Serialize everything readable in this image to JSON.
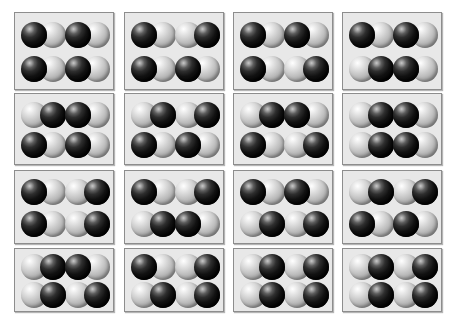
{
  "figure": {
    "grid_rows": 4,
    "grid_cols": 4,
    "molecules_per_cell": 4,
    "molecule_layout": "2x2",
    "colors": {
      "page_background": "#ffffff",
      "cell_background": "#e8e8e8",
      "cell_border": "#8d8d8d",
      "atom_dark": "#111111",
      "atom_light": "#c9c9c9"
    },
    "atom_types": {
      "dark": "dark-atom",
      "light": "light-atom"
    },
    "orientation_legend": {
      "dark-light": "dark sphere on the left, light sphere on the right",
      "light-dark": "light sphere on the left, dark sphere on the right"
    }
  },
  "cells": [
    {
      "id": "cell-r1c1",
      "row": 1,
      "col": 1,
      "x": 14,
      "y": 12,
      "w": 100,
      "h": 78,
      "molecules": [
        {
          "slot": "top-left",
          "orientation": "dark-light"
        },
        {
          "slot": "top-right",
          "orientation": "dark-light"
        },
        {
          "slot": "bottom-left",
          "orientation": "dark-light"
        },
        {
          "slot": "bottom-right",
          "orientation": "dark-light"
        }
      ]
    },
    {
      "id": "cell-r1c2",
      "row": 1,
      "col": 2,
      "x": 124,
      "y": 12,
      "w": 100,
      "h": 78,
      "molecules": [
        {
          "slot": "top-left",
          "orientation": "dark-light"
        },
        {
          "slot": "top-right",
          "orientation": "light-dark"
        },
        {
          "slot": "bottom-left",
          "orientation": "dark-light"
        },
        {
          "slot": "bottom-right",
          "orientation": "dark-light"
        }
      ]
    },
    {
      "id": "cell-r1c3",
      "row": 1,
      "col": 3,
      "x": 233,
      "y": 12,
      "w": 100,
      "h": 78,
      "molecules": [
        {
          "slot": "top-left",
          "orientation": "dark-light"
        },
        {
          "slot": "top-right",
          "orientation": "dark-light"
        },
        {
          "slot": "bottom-left",
          "orientation": "dark-light"
        },
        {
          "slot": "bottom-right",
          "orientation": "light-dark"
        }
      ]
    },
    {
      "id": "cell-r1c4",
      "row": 1,
      "col": 4,
      "x": 342,
      "y": 12,
      "w": 100,
      "h": 78,
      "molecules": [
        {
          "slot": "top-left",
          "orientation": "dark-light"
        },
        {
          "slot": "top-right",
          "orientation": "dark-light"
        },
        {
          "slot": "bottom-left",
          "orientation": "light-dark"
        },
        {
          "slot": "bottom-right",
          "orientation": "dark-light"
        }
      ]
    },
    {
      "id": "cell-r2c1",
      "row": 2,
      "col": 1,
      "x": 14,
      "y": 93,
      "w": 100,
      "h": 72,
      "molecules": [
        {
          "slot": "top-left",
          "orientation": "light-dark"
        },
        {
          "slot": "top-right",
          "orientation": "dark-light"
        },
        {
          "slot": "bottom-left",
          "orientation": "dark-light"
        },
        {
          "slot": "bottom-right",
          "orientation": "dark-light"
        }
      ]
    },
    {
      "id": "cell-r2c2",
      "row": 2,
      "col": 2,
      "x": 124,
      "y": 93,
      "w": 100,
      "h": 72,
      "molecules": [
        {
          "slot": "top-left",
          "orientation": "light-dark"
        },
        {
          "slot": "top-right",
          "orientation": "light-dark"
        },
        {
          "slot": "bottom-left",
          "orientation": "dark-light"
        },
        {
          "slot": "bottom-right",
          "orientation": "dark-light"
        }
      ]
    },
    {
      "id": "cell-r2c3",
      "row": 2,
      "col": 3,
      "x": 233,
      "y": 93,
      "w": 100,
      "h": 72,
      "molecules": [
        {
          "slot": "top-left",
          "orientation": "light-dark"
        },
        {
          "slot": "top-right",
          "orientation": "dark-light"
        },
        {
          "slot": "bottom-left",
          "orientation": "dark-light"
        },
        {
          "slot": "bottom-right",
          "orientation": "light-dark"
        }
      ]
    },
    {
      "id": "cell-r2c4",
      "row": 2,
      "col": 4,
      "x": 342,
      "y": 93,
      "w": 100,
      "h": 72,
      "molecules": [
        {
          "slot": "top-left",
          "orientation": "light-dark"
        },
        {
          "slot": "top-right",
          "orientation": "dark-light"
        },
        {
          "slot": "bottom-left",
          "orientation": "light-dark"
        },
        {
          "slot": "bottom-right",
          "orientation": "dark-light"
        }
      ]
    },
    {
      "id": "cell-r3c1",
      "row": 3,
      "col": 1,
      "x": 14,
      "y": 170,
      "w": 100,
      "h": 74,
      "molecules": [
        {
          "slot": "top-left",
          "orientation": "dark-light"
        },
        {
          "slot": "top-right",
          "orientation": "light-dark"
        },
        {
          "slot": "bottom-left",
          "orientation": "dark-light"
        },
        {
          "slot": "bottom-right",
          "orientation": "light-dark"
        }
      ]
    },
    {
      "id": "cell-r3c2",
      "row": 3,
      "col": 2,
      "x": 124,
      "y": 170,
      "w": 100,
      "h": 74,
      "molecules": [
        {
          "slot": "top-left",
          "orientation": "dark-light"
        },
        {
          "slot": "top-right",
          "orientation": "light-dark"
        },
        {
          "slot": "bottom-left",
          "orientation": "light-dark"
        },
        {
          "slot": "bottom-right",
          "orientation": "dark-light"
        }
      ]
    },
    {
      "id": "cell-r3c3",
      "row": 3,
      "col": 3,
      "x": 233,
      "y": 170,
      "w": 100,
      "h": 74,
      "molecules": [
        {
          "slot": "top-left",
          "orientation": "dark-light"
        },
        {
          "slot": "top-right",
          "orientation": "dark-light"
        },
        {
          "slot": "bottom-left",
          "orientation": "light-dark"
        },
        {
          "slot": "bottom-right",
          "orientation": "light-dark"
        }
      ]
    },
    {
      "id": "cell-r3c4",
      "row": 3,
      "col": 4,
      "x": 342,
      "y": 170,
      "w": 100,
      "h": 74,
      "molecules": [
        {
          "slot": "top-left",
          "orientation": "light-dark"
        },
        {
          "slot": "top-right",
          "orientation": "light-dark"
        },
        {
          "slot": "bottom-left",
          "orientation": "dark-light"
        },
        {
          "slot": "bottom-right",
          "orientation": "dark-light"
        }
      ]
    },
    {
      "id": "cell-r4c1",
      "row": 4,
      "col": 1,
      "x": 14,
      "y": 248,
      "w": 100,
      "h": 64,
      "molecules": [
        {
          "slot": "top-left",
          "orientation": "light-dark"
        },
        {
          "slot": "top-right",
          "orientation": "dark-light"
        },
        {
          "slot": "bottom-left",
          "orientation": "light-dark"
        },
        {
          "slot": "bottom-right",
          "orientation": "light-dark"
        }
      ]
    },
    {
      "id": "cell-r4c2",
      "row": 4,
      "col": 2,
      "x": 124,
      "y": 248,
      "w": 100,
      "h": 64,
      "molecules": [
        {
          "slot": "top-left",
          "orientation": "dark-light"
        },
        {
          "slot": "top-right",
          "orientation": "light-dark"
        },
        {
          "slot": "bottom-left",
          "orientation": "light-dark"
        },
        {
          "slot": "bottom-right",
          "orientation": "light-dark"
        }
      ]
    },
    {
      "id": "cell-r4c3",
      "row": 4,
      "col": 3,
      "x": 233,
      "y": 248,
      "w": 100,
      "h": 64,
      "molecules": [
        {
          "slot": "top-left",
          "orientation": "light-dark"
        },
        {
          "slot": "top-right",
          "orientation": "light-dark"
        },
        {
          "slot": "bottom-left",
          "orientation": "light-dark"
        },
        {
          "slot": "bottom-right",
          "orientation": "light-dark"
        }
      ]
    },
    {
      "id": "cell-r4c4",
      "row": 4,
      "col": 4,
      "x": 342,
      "y": 248,
      "w": 100,
      "h": 64,
      "molecules": [
        {
          "slot": "top-left",
          "orientation": "light-dark"
        },
        {
          "slot": "top-right",
          "orientation": "light-dark"
        },
        {
          "slot": "bottom-left",
          "orientation": "light-dark"
        },
        {
          "slot": "bottom-right",
          "orientation": "light-dark"
        }
      ]
    }
  ]
}
